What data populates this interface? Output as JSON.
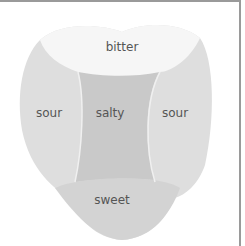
{
  "diagram": {
    "regions": [
      {
        "id": "bitter",
        "label": "bitter",
        "color": "#f6f6f6"
      },
      {
        "id": "sour_left",
        "label": "sour",
        "color": "#dedede"
      },
      {
        "id": "salty",
        "label": "salty",
        "color": "#c9c9c9"
      },
      {
        "id": "sour_right",
        "label": "sour",
        "color": "#dedede"
      },
      {
        "id": "sweet",
        "label": "sweet",
        "color": "#d3d3d3"
      }
    ]
  }
}
